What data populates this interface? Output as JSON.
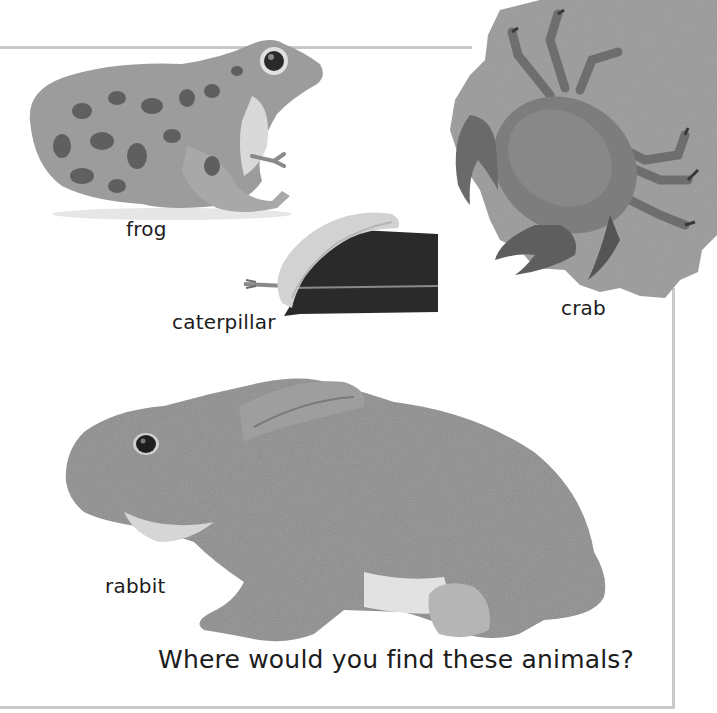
{
  "page": {
    "question": "Where would you find these animals?",
    "style": "grayscale",
    "frame_color": "#c9c9c9",
    "background": "#ffffff"
  },
  "animals": [
    {
      "id": "frog",
      "label": "frog",
      "icon": "frog-photo"
    },
    {
      "id": "caterpillar",
      "label": "caterpillar",
      "icon": "caterpillar-on-leaf-photo"
    },
    {
      "id": "crab",
      "label": "crab",
      "icon": "crab-on-sand-photo"
    },
    {
      "id": "rabbit",
      "label": "rabbit",
      "icon": "rabbit-photo"
    }
  ]
}
